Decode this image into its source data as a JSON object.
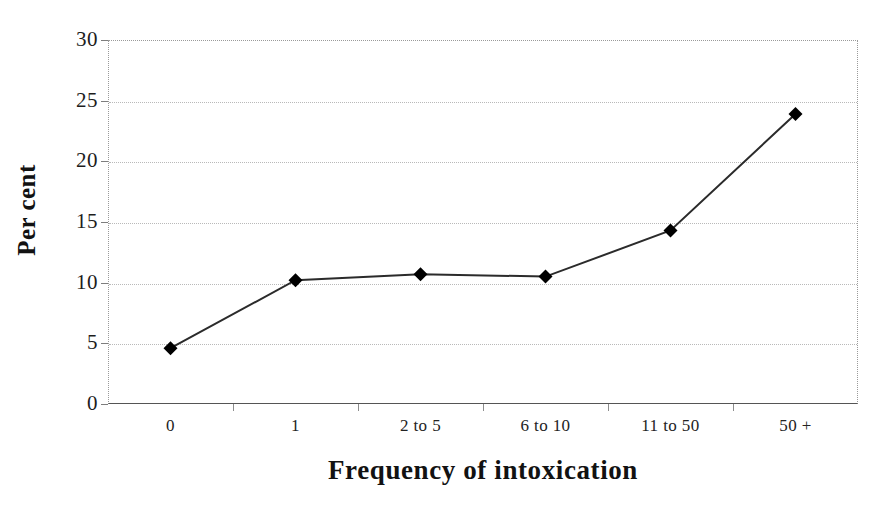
{
  "chart_data": {
    "type": "line",
    "title": "",
    "subtitle": "",
    "xlabel": "Frequency of intoxication",
    "ylabel": "Per cent",
    "categories": [
      "0",
      "1",
      "2 to 5",
      "6 to 10",
      "11 to 50",
      "50 +"
    ],
    "values": [
      4.6,
      10.2,
      10.7,
      10.5,
      14.3,
      23.9
    ],
    "series": [
      {
        "name": "Per cent",
        "values": [
          4.6,
          10.2,
          10.7,
          10.5,
          14.3,
          23.9
        ],
        "marker": "diamond",
        "marker_color": "#000000",
        "line_color": "#2b2b2b"
      }
    ],
    "ylim": [
      0,
      30
    ],
    "y_ticks": [
      0,
      5,
      10,
      15,
      20,
      25,
      30
    ],
    "y_tick_labels": [
      "0",
      "5",
      "10",
      "15",
      "20",
      "25",
      "30"
    ],
    "grid": true,
    "grid_style": "dotted",
    "grid_axis": "y",
    "legend": false,
    "legend_position": "none",
    "plot_background": "#ffffff",
    "frame_color": "#9a9a9a",
    "axis_color": "#555555"
  }
}
